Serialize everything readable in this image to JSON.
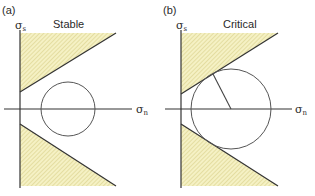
{
  "colors": {
    "line": "#333333",
    "hatch_fill": "#f5f1c4",
    "hatch_stroke": "#d9d08a",
    "circle": "#555555",
    "background": "#ffffff"
  },
  "panels": [
    {
      "id": "a",
      "tag": "(a)",
      "title": "Stable",
      "y_axis_label": "σs",
      "y_axis_symbol": "σ",
      "y_axis_sub": "s",
      "x_axis_label": "σn",
      "x_axis_symbol": "σ",
      "x_axis_sub": "n",
      "mohr_circle": {
        "center": [
          68,
          109
        ],
        "radius": 27,
        "touches_envelope": false
      }
    },
    {
      "id": "b",
      "tag": "(b)",
      "title": "Critical",
      "y_axis_label": "σs",
      "y_axis_symbol": "σ",
      "y_axis_sub": "s",
      "x_axis_label": "σn",
      "x_axis_symbol": "σ",
      "x_axis_sub": "n",
      "mohr_circle": {
        "center": [
          231,
          109
        ],
        "radius": 40,
        "touches_envelope": true,
        "radius_line_to": [
          213,
          75
        ]
      }
    }
  ]
}
